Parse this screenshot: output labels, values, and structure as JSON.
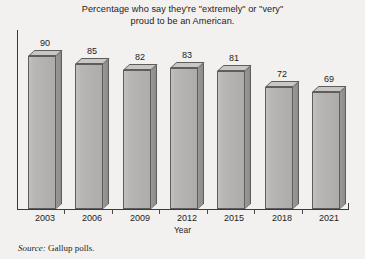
{
  "chart_data": {
    "type": "bar",
    "title": "Percentage who say they're \"extremely\" or \"very\"\nproud to be an American.",
    "xlabel": "Year",
    "ylabel": "",
    "categories": [
      "2003",
      "2006",
      "2009",
      "2012",
      "2015",
      "2018",
      "2021"
    ],
    "values": [
      90,
      85,
      82,
      83,
      81,
      72,
      69
    ],
    "value_labels": [
      "90",
      "85",
      "82",
      "83",
      "81",
      "72",
      "69"
    ],
    "ylim": [
      0,
      100
    ],
    "grid": false,
    "legend": null,
    "style": "3d-bar",
    "bar_face_color": "#b5b3b1",
    "bar_side_color": "#929090",
    "bar_top_color": "#c9c7c5",
    "bar_outline_color": "#5d5d5d",
    "background_color": "#f3f1ef",
    "axis_color": "#3a3a3a",
    "text_color": "#1c1c1c"
  },
  "source": {
    "label": "Source:",
    "text": "Gallup polls."
  }
}
